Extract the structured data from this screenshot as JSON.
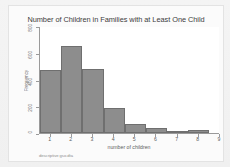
{
  "chart_data": {
    "type": "bar",
    "title": "Number of Children in Families with at Least One Child",
    "xlabel": "number of children",
    "ylabel": "Frequency",
    "categories": [
      "1",
      "2",
      "3",
      "4",
      "5",
      "6",
      "7",
      "8"
    ],
    "values": [
      470,
      650,
      480,
      190,
      70,
      35,
      15,
      25
    ],
    "x": [
      1,
      2,
      3,
      4,
      5,
      6,
      7,
      8
    ],
    "xlim": [
      0.5,
      9
    ],
    "ylim": [
      0,
      800
    ],
    "xticks": [
      "1",
      "2",
      "3",
      "4",
      "5",
      "6",
      "7",
      "8",
      "9"
    ],
    "xtick_values": [
      1,
      2,
      3,
      4,
      5,
      6,
      7,
      8,
      9
    ],
    "yticks": [
      "0",
      "200",
      "400",
      "600",
      "800"
    ],
    "ytick_values": [
      0,
      200,
      400,
      600,
      800
    ],
    "grid": false,
    "legend": null,
    "bar_color": "#8d8d8d",
    "bar_border_color": "#6f6f6f",
    "axis_color": "#9a9a9a",
    "plot_background": "#ffffff",
    "canvas_background": "#fbfbfb",
    "bin_width": 1,
    "annotations": []
  },
  "caption": "descriptive gso.dta"
}
